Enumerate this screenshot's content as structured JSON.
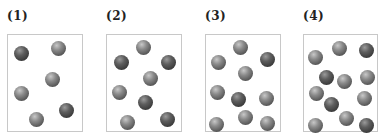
{
  "panels": [
    {
      "label": "(1)",
      "label_x": 7,
      "box": {
        "x": 7,
        "w": 76
      },
      "balls": [
        {
          "x": 21,
          "y": 53,
          "tone": "dark"
        },
        {
          "x": 58,
          "y": 48,
          "tone": "light"
        },
        {
          "x": 52,
          "y": 79,
          "tone": "light"
        },
        {
          "x": 21,
          "y": 93,
          "tone": "light"
        },
        {
          "x": 66,
          "y": 110,
          "tone": "dark"
        },
        {
          "x": 36,
          "y": 119,
          "tone": "light"
        }
      ]
    },
    {
      "label": "(2)",
      "label_x": 106,
      "box": {
        "x": 106,
        "w": 76
      },
      "balls": [
        {
          "x": 143,
          "y": 47,
          "tone": "light"
        },
        {
          "x": 121,
          "y": 62,
          "tone": "dark"
        },
        {
          "x": 168,
          "y": 62,
          "tone": "dark"
        },
        {
          "x": 150,
          "y": 78,
          "tone": "light"
        },
        {
          "x": 119,
          "y": 92,
          "tone": "light"
        },
        {
          "x": 145,
          "y": 102,
          "tone": "dark"
        },
        {
          "x": 167,
          "y": 119,
          "tone": "dark"
        },
        {
          "x": 127,
          "y": 122,
          "tone": "light"
        }
      ]
    },
    {
      "label": "(3)",
      "label_x": 205,
      "box": {
        "x": 205,
        "w": 76
      },
      "balls": [
        {
          "x": 240,
          "y": 47,
          "tone": "light"
        },
        {
          "x": 218,
          "y": 62,
          "tone": "light"
        },
        {
          "x": 267,
          "y": 59,
          "tone": "dark"
        },
        {
          "x": 245,
          "y": 73,
          "tone": "light"
        },
        {
          "x": 217,
          "y": 92,
          "tone": "light"
        },
        {
          "x": 238,
          "y": 99,
          "tone": "dark"
        },
        {
          "x": 266,
          "y": 98,
          "tone": "light"
        },
        {
          "x": 245,
          "y": 117,
          "tone": "light"
        },
        {
          "x": 216,
          "y": 124,
          "tone": "light"
        },
        {
          "x": 267,
          "y": 123,
          "tone": "light"
        }
      ]
    },
    {
      "label": "(4)",
      "label_x": 303,
      "box": {
        "x": 303,
        "w": 75
      },
      "balls": [
        {
          "x": 339,
          "y": 48,
          "tone": "light"
        },
        {
          "x": 366,
          "y": 50,
          "tone": "dark"
        },
        {
          "x": 315,
          "y": 57,
          "tone": "light"
        },
        {
          "x": 326,
          "y": 77,
          "tone": "dark"
        },
        {
          "x": 344,
          "y": 81,
          "tone": "light"
        },
        {
          "x": 367,
          "y": 77,
          "tone": "light"
        },
        {
          "x": 316,
          "y": 93,
          "tone": "light"
        },
        {
          "x": 331,
          "y": 104,
          "tone": "dark"
        },
        {
          "x": 364,
          "y": 98,
          "tone": "light"
        },
        {
          "x": 346,
          "y": 118,
          "tone": "light"
        },
        {
          "x": 315,
          "y": 125,
          "tone": "light"
        },
        {
          "x": 366,
          "y": 125,
          "tone": "dark"
        }
      ]
    }
  ]
}
